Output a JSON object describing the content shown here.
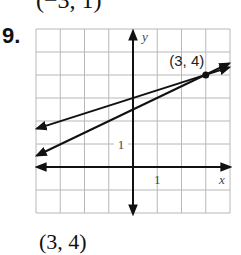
{
  "previous_answer": "(−3, 1)",
  "problem": {
    "number": "9.",
    "answer": "(3, 4)"
  },
  "chart_data": {
    "type": "line",
    "title": "",
    "xlabel": "x",
    "ylabel": "y",
    "xlim": [
      -4,
      4
    ],
    "ylim": [
      -2,
      6
    ],
    "grid": true,
    "tick_labels": {
      "x": "1",
      "y": "1"
    },
    "series": [
      {
        "name": "line 1",
        "equation": "y = (1/3)x + 3",
        "slope": 0.3333,
        "intercept": 3,
        "x": [
          -4,
          4
        ],
        "y": [
          1.67,
          4.33
        ]
      },
      {
        "name": "line 2",
        "equation": "y = (1/2)x + 2.5",
        "slope": 0.5,
        "intercept": 2.5,
        "x": [
          -4,
          4
        ],
        "y": [
          0.5,
          4.5
        ]
      }
    ],
    "annotations": [
      {
        "label": "(3, 4)",
        "x": 3,
        "y": 4,
        "marker": "point"
      }
    ]
  },
  "colors": {
    "grid": "#b8b8b8",
    "ink": "#111111"
  }
}
